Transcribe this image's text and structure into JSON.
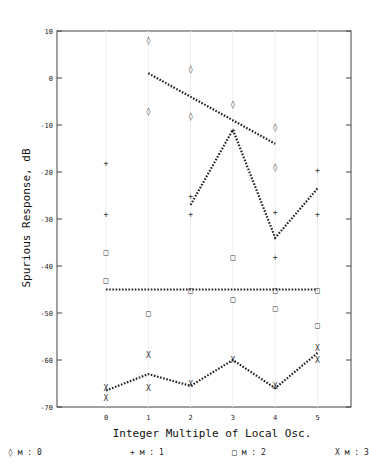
{
  "chart_data": {
    "type": "scatter",
    "title": "",
    "xlabel": "Integer Multiple of Local Osc.",
    "ylabel": "Spurious Response, dB",
    "xlim": [
      -1.2,
      6.0
    ],
    "ylim": [
      -70,
      10
    ],
    "x_ticks": [
      "0",
      "1",
      "2",
      "3",
      "4",
      "5"
    ],
    "y_ticks": [
      "10",
      "0",
      "-10",
      "-20",
      "-30",
      "-40",
      "-50",
      "-60",
      "-70"
    ],
    "grid": false,
    "legend_position": "bottom",
    "legend": [
      {
        "marker": "◊",
        "label": "◊ м : 0"
      },
      {
        "marker": "+",
        "label": "+ м : 1"
      },
      {
        "marker": "□",
        "label": "□ м : 2"
      },
      {
        "marker": "X",
        "label": "X м : 3"
      }
    ],
    "series": [
      {
        "name": "m=0",
        "marker": "diamond",
        "points": [
          [
            1,
            8
          ],
          [
            1,
            -7
          ],
          [
            2,
            2
          ],
          [
            2,
            -8
          ],
          [
            3,
            -5.5
          ],
          [
            4,
            -10.5
          ],
          [
            4,
            -19
          ]
        ],
        "fit_line": [
          [
            1,
            1
          ],
          [
            4,
            -14
          ]
        ]
      },
      {
        "name": "m=1",
        "marker": "plus",
        "points": [
          [
            0,
            -18
          ],
          [
            0,
            -29
          ],
          [
            2,
            -25
          ],
          [
            2,
            -29
          ],
          [
            3,
            -11
          ],
          [
            4,
            -28.5
          ],
          [
            4,
            -38
          ],
          [
            5,
            -19.5
          ],
          [
            5,
            -29
          ]
        ],
        "fit_line": [
          [
            2,
            -27
          ],
          [
            3,
            -11
          ],
          [
            4,
            -34
          ],
          [
            5,
            -23.5
          ]
        ]
      },
      {
        "name": "m=2",
        "marker": "square",
        "points": [
          [
            0,
            -37
          ],
          [
            0,
            -43
          ],
          [
            1,
            -50
          ],
          [
            2,
            -45
          ],
          [
            3,
            -38
          ],
          [
            3,
            -47
          ],
          [
            4,
            -45
          ],
          [
            4,
            -49
          ],
          [
            5,
            -45
          ],
          [
            5,
            -52.5
          ]
        ],
        "fit_line": [
          [
            0,
            -45
          ],
          [
            5,
            -45
          ]
        ]
      },
      {
        "name": "m=3",
        "marker": "x",
        "points": [
          [
            0,
            -66
          ],
          [
            0,
            -68
          ],
          [
            1,
            -59
          ],
          [
            1,
            -66
          ],
          [
            2,
            -65
          ],
          [
            3,
            -60
          ],
          [
            4,
            -65.5
          ],
          [
            5,
            -57.5
          ],
          [
            5,
            -60
          ]
        ],
        "fit_line": [
          [
            0,
            -66.5
          ],
          [
            1,
            -63
          ],
          [
            2,
            -65.5
          ],
          [
            3,
            -60
          ],
          [
            4,
            -66
          ],
          [
            5,
            -58.5
          ]
        ]
      }
    ]
  }
}
